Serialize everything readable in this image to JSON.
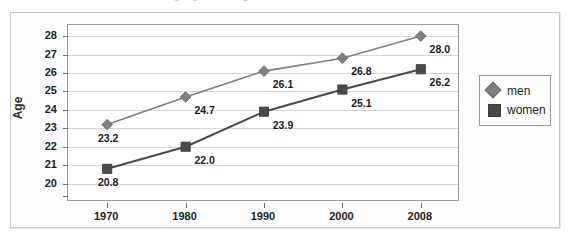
{
  "top_strip": {
    "clipped_text": "Average age at marriage, men and women"
  },
  "chart_data": {
    "type": "line",
    "title": "",
    "xlabel": "",
    "ylabel": "Age",
    "x": [
      1970,
      1980,
      1990,
      2000,
      2008
    ],
    "categories": [
      "1970",
      "1980",
      "1990",
      "2000",
      "2008"
    ],
    "series": [
      {
        "name": "men",
        "marker": "diamond",
        "color": "#7f7f7f",
        "values": [
          23.2,
          24.7,
          26.1,
          26.8,
          28.0
        ],
        "labels": [
          "23.2",
          "24.7",
          "26.1",
          "26.8",
          "28.0"
        ]
      },
      {
        "name": "women",
        "marker": "square",
        "color": "#4a4a4a",
        "values": [
          20.8,
          22.0,
          23.9,
          25.1,
          26.2
        ],
        "labels": [
          "20.8",
          "22.0",
          "23.9",
          "25.1",
          "26.2"
        ]
      }
    ],
    "ylim": [
      19,
      28.6
    ],
    "yticks": [
      20,
      21,
      22,
      23,
      24,
      25,
      26,
      27,
      28
    ],
    "ytick_labels": [
      "20",
      "21",
      "22",
      "23",
      "24",
      "25",
      "26",
      "27",
      "28"
    ],
    "grid": true,
    "legend_position": "right",
    "legend_entries": [
      "men",
      "women"
    ]
  },
  "colors": {
    "men": "#7f7f7f",
    "women": "#4a4a4a",
    "gridline": "#d6d6d6",
    "axis": "#9a9a9a",
    "frame": "#c9c9c9",
    "plot_background": "#ffffff",
    "figure_background": "#fdfdfd",
    "text": "#1a1a1a"
  }
}
